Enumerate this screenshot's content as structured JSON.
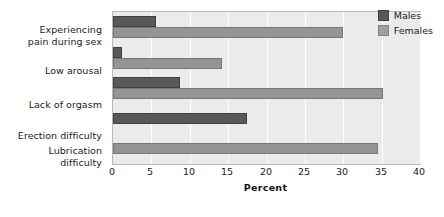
{
  "chart_data": {
    "type": "bar",
    "orientation": "horizontal",
    "title": "",
    "xlabel": "Percent",
    "ylabel": "",
    "xlim": [
      0,
      40
    ],
    "xticks": [
      0,
      5,
      10,
      15,
      20,
      25,
      30,
      35,
      40
    ],
    "grid": true,
    "legend_position": "top-right",
    "categories": [
      "Experiencing\npain during sex",
      "Low arousal",
      "Lack of orgasm",
      "Erection difficulty",
      "Lubrication\ndifficulty"
    ],
    "category_labels": [
      {
        "line1": "Experiencing",
        "line2": "pain during sex"
      },
      {
        "line1": "Low arousal",
        "line2": ""
      },
      {
        "line1": "Lack of orgasm",
        "line2": ""
      },
      {
        "line1": "Erection difficulty",
        "line2": ""
      },
      {
        "line1": "Lubrication",
        "line2": "difficulty"
      }
    ],
    "series": [
      {
        "name": "Males",
        "color": "#58585a",
        "values": [
          5.6,
          1.2,
          8.7,
          17.5,
          null
        ]
      },
      {
        "name": "Females",
        "color": "#949497",
        "values": [
          30.0,
          14.2,
          35.2,
          null,
          34.5
        ]
      }
    ]
  },
  "legend": {
    "items": [
      {
        "label": "Males",
        "color": "#58585a"
      },
      {
        "label": "Females",
        "color": "#a0a0a3"
      }
    ]
  },
  "axis": {
    "x_title": "Percent",
    "x_tick_labels": [
      "0",
      "5",
      "10",
      "15",
      "20",
      "25",
      "30",
      "35",
      "40"
    ]
  },
  "colors": {
    "plot_background": "#ebebeb",
    "gridline": "#fdfdfd",
    "plot_border": "#b9b9b9",
    "text": "#1a1a1a",
    "males": "#58585a",
    "females": "#949497"
  }
}
